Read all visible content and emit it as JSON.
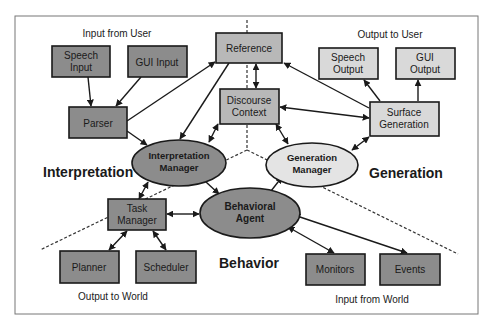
{
  "diagram": {
    "section_labels": {
      "input_from_user": "Input from User",
      "output_to_user": "Output to User",
      "output_to_world": "Output to World",
      "input_from_world": "Input from World",
      "interpretation": "Interpretation",
      "generation": "Generation",
      "behavior": "Behavior"
    },
    "nodes": {
      "speech_input": [
        "Speech",
        "Input"
      ],
      "gui_input": [
        "GUI Input"
      ],
      "parser": [
        "Parser"
      ],
      "reference": [
        "Reference"
      ],
      "discourse_context": [
        "Discourse",
        "Context"
      ],
      "speech_output": [
        "Speech",
        "Output"
      ],
      "gui_output": [
        "GUI",
        "Output"
      ],
      "surface_generation": [
        "Surface",
        "Generation"
      ],
      "interpretation_manager": [
        "Interpretation",
        "Manager"
      ],
      "generation_manager": [
        "Generation",
        "Manager"
      ],
      "behavioral_agent": [
        "Behavioral",
        "Agent"
      ],
      "task_manager": [
        "Task",
        "Manager"
      ],
      "planner": [
        "Planner"
      ],
      "scheduler": [
        "Scheduler"
      ],
      "monitors": [
        "Monitors"
      ],
      "events": [
        "Events"
      ]
    },
    "edges": [
      {
        "from": "Speech Input",
        "to": "Parser",
        "type": "directed"
      },
      {
        "from": "GUI Input",
        "to": "Parser",
        "type": "directed"
      },
      {
        "from": "Parser",
        "to": "Reference",
        "type": "directed"
      },
      {
        "from": "Parser",
        "to": "Interpretation Manager",
        "type": "directed"
      },
      {
        "from": "Reference",
        "to": "Interpretation Manager",
        "type": "directed"
      },
      {
        "from": "Reference",
        "to": "Discourse Context",
        "type": "bidirectional"
      },
      {
        "from": "Surface Generation",
        "to": "Reference",
        "type": "directed"
      },
      {
        "from": "Surface Generation",
        "to": "Discourse Context",
        "type": "bidirectional"
      },
      {
        "from": "Discourse Context",
        "to": "Interpretation Manager",
        "type": "bidirectional"
      },
      {
        "from": "Discourse Context",
        "to": "Generation Manager",
        "type": "bidirectional"
      },
      {
        "from": "Generation Manager",
        "to": "Surface Generation",
        "type": "bidirectional"
      },
      {
        "from": "Surface Generation",
        "to": "Speech Output",
        "type": "directed"
      },
      {
        "from": "Surface Generation",
        "to": "GUI Output",
        "type": "directed"
      },
      {
        "from": "Interpretation Manager",
        "to": "Task Manager",
        "type": "bidirectional"
      },
      {
        "from": "Interpretation Manager",
        "to": "Behavioral Agent",
        "type": "directed"
      },
      {
        "from": "Behavioral Agent",
        "to": "Generation Manager",
        "type": "directed"
      },
      {
        "from": "Task Manager",
        "to": "Behavioral Agent",
        "type": "bidirectional"
      },
      {
        "from": "Task Manager",
        "to": "Planner",
        "type": "bidirectional"
      },
      {
        "from": "Task Manager",
        "to": "Scheduler",
        "type": "bidirectional"
      },
      {
        "from": "Behavioral Agent",
        "to": "Monitors",
        "type": "bidirectional"
      },
      {
        "from": "Behavioral Agent",
        "to": "Events",
        "type": "bidirectional"
      }
    ],
    "colors": {
      "dark_node": "#8c8c8c",
      "mid_node": "#b8b8b8",
      "light_node": "#d9d9d9",
      "light_ellipse": "#e4e4e4",
      "stroke": "#1a1a1a"
    }
  }
}
